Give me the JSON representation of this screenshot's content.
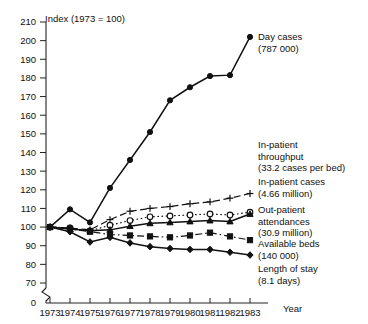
{
  "chart_data": {
    "type": "line",
    "title": "Index (1973 = 100)",
    "xlabel": "Year",
    "ylabel": "",
    "grid": false,
    "legend_position": "right-inline",
    "axis_break_y": true,
    "x": [
      1973,
      1974,
      1975,
      1976,
      1977,
      1978,
      1979,
      1980,
      1981,
      1982,
      1983
    ],
    "xtick_labels": [
      "1973",
      "1974",
      "1975",
      "1976",
      "1977",
      "1978",
      "1979",
      "1980",
      "1981",
      "1982",
      "1983"
    ],
    "ytick_labels": [
      "0",
      "70",
      "80",
      "90",
      "100",
      "110",
      "120",
      "130",
      "140",
      "150",
      "160",
      "170",
      "180",
      "190",
      "200",
      "210"
    ],
    "ylim": [
      70,
      210
    ],
    "xlim": [
      1973,
      1983
    ],
    "series": [
      {
        "name": "Day cases",
        "label_line1": "Day cases",
        "label_line2": "(787 000)",
        "marker": "filled-circle",
        "linestyle": "solid",
        "values": [
          100,
          109.5,
          102.5,
          121,
          136,
          151,
          168,
          175,
          181,
          181.5,
          202
        ]
      },
      {
        "name": "In-patient throughput",
        "label_line1": "In-patient",
        "label_line2": "throughput",
        "label_line3": "(33.2 cases per bed)",
        "marker": "plus",
        "linestyle": "dashed",
        "values": [
          100,
          99.5,
          98.5,
          104,
          108.5,
          110,
          111,
          112.5,
          113.5,
          115.5,
          118
        ]
      },
      {
        "name": "In-patient cases",
        "label_line1": "In-patient cases",
        "label_line2": "(4.66 million)",
        "marker": "open-circle",
        "linestyle": "dotted",
        "values": [
          100,
          99.5,
          98,
          101,
          103.5,
          105.5,
          106,
          106.5,
          107,
          106.5,
          108
        ]
      },
      {
        "name": "Out-patient attendances",
        "label_line1": "Out-patient",
        "label_line2": "attendances",
        "label_line3": "(30.9 million)",
        "marker": "filled-triangle",
        "linestyle": "solid",
        "values": [
          100,
          99,
          98,
          98.5,
          100.5,
          102,
          102.5,
          103,
          103.5,
          103,
          107
        ]
      },
      {
        "name": "Available beds",
        "label_line1": "Available beds",
        "label_line2": "(140 000)",
        "marker": "filled-square",
        "linestyle": "dash-dot",
        "values": [
          100,
          99,
          97.5,
          96,
          95.5,
          95,
          94.5,
          95.5,
          97,
          95,
          93
        ]
      },
      {
        "name": "Length of stay",
        "label_line1": "Length of stay",
        "label_line2": "(8.1 days)",
        "marker": "filled-diamond",
        "linestyle": "solid",
        "values": [
          100,
          97.5,
          92,
          94.5,
          91.5,
          89.5,
          88.5,
          88,
          88,
          86.5,
          85
        ]
      }
    ]
  }
}
